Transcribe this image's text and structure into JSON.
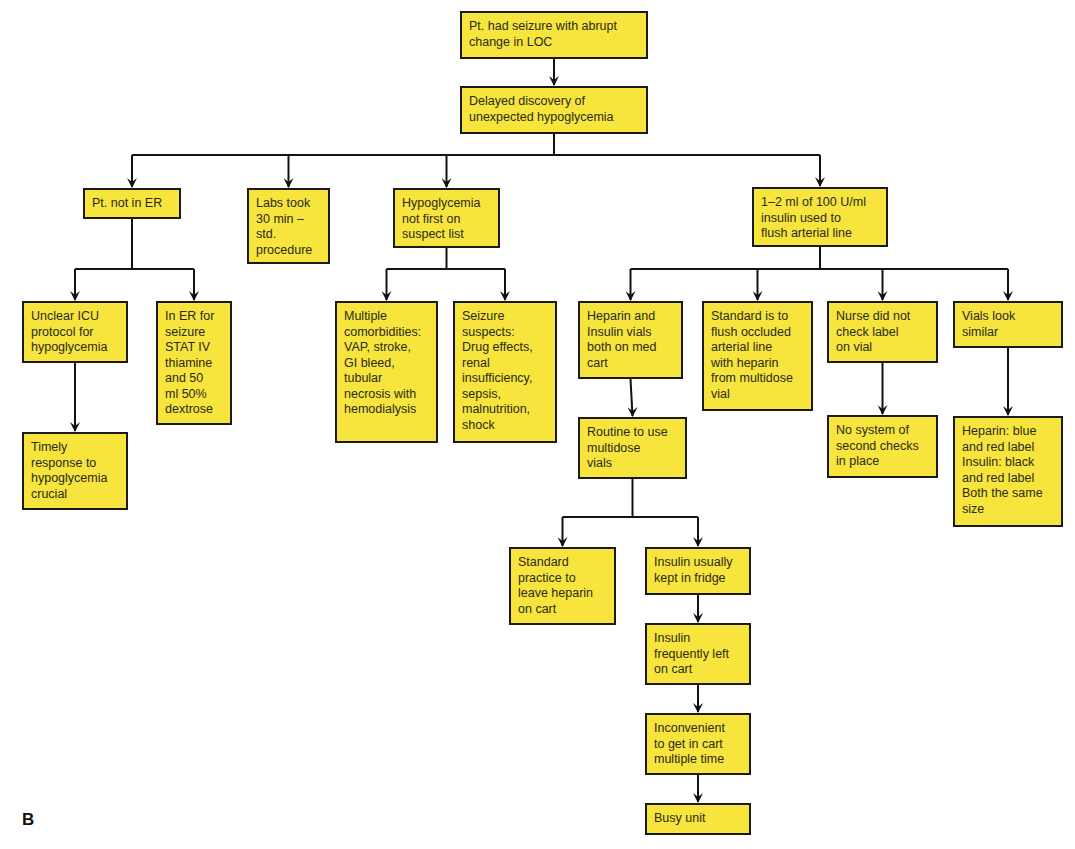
{
  "panel_label": "B",
  "colors": {
    "box_fill": "#f7e43c",
    "box_border": "#1a1a1a",
    "line": "#111111"
  },
  "nodes": [
    {
      "id": "n0",
      "text": "Pt. had seizure with abrupt\nchange in LOC",
      "x": 460,
      "y": 11,
      "w": 188,
      "h": 48
    },
    {
      "id": "n1",
      "text": "Delayed discovery of\nunexpected hypoglycemia",
      "x": 460,
      "y": 86,
      "w": 188,
      "h": 48
    },
    {
      "id": "n2",
      "text": "Pt. not in ER",
      "x": 83,
      "y": 188,
      "w": 98,
      "h": 31
    },
    {
      "id": "n3",
      "text": "Labs took\n30 min –\nstd.\nprocedure",
      "x": 247,
      "y": 188,
      "w": 83,
      "h": 76
    },
    {
      "id": "n4",
      "text": "Hypoglycemia\nnot first on\nsuspect list",
      "x": 393,
      "y": 188,
      "w": 107,
      "h": 60
    },
    {
      "id": "n5",
      "text": "1–2 ml of 100 U/ml\ninsulin used to\nflush arterial line",
      "x": 752,
      "y": 187,
      "w": 136,
      "h": 60
    },
    {
      "id": "n6",
      "text": "Unclear ICU\nprotocol for\nhypoglycemia",
      "x": 22,
      "y": 301,
      "w": 106,
      "h": 62
    },
    {
      "id": "n7",
      "text": "In ER for\nseizure\nSTAT IV\nthiamine\nand 50\nml 50%\ndextrose",
      "x": 156,
      "y": 301,
      "w": 76,
      "h": 124
    },
    {
      "id": "n8",
      "text": "Multiple\ncomorbidities:\nVAP, stroke,\nGI bleed,\ntubular\nnecrosis with\nhemodialysis",
      "x": 335,
      "y": 301,
      "w": 103,
      "h": 142
    },
    {
      "id": "n9",
      "text": "Seizure\nsuspects:\nDrug effects,\nrenal\ninsufficiency,\nsepsis,\nmalnutrition,\nshock",
      "x": 453,
      "y": 301,
      "w": 104,
      "h": 142
    },
    {
      "id": "n10",
      "text": "Heparin and\nInsulin vials\nboth on med\ncart",
      "x": 578,
      "y": 301,
      "w": 105,
      "h": 78
    },
    {
      "id": "n11",
      "text": "Standard is to\nflush occluded\narterial line\nwith heparin\nfrom multidose\nvial",
      "x": 702,
      "y": 301,
      "w": 111,
      "h": 110
    },
    {
      "id": "n12",
      "text": "Nurse did not\ncheck label\non vial",
      "x": 827,
      "y": 301,
      "w": 111,
      "h": 62
    },
    {
      "id": "n13",
      "text": "Vials look\nsimilar",
      "x": 953,
      "y": 301,
      "w": 110,
      "h": 47
    },
    {
      "id": "n14",
      "text": "Routine to use\nmultidose\nvials",
      "x": 578,
      "y": 417,
      "w": 109,
      "h": 62
    },
    {
      "id": "n15",
      "text": "Timely\nresponse to\nhypoglycemia\ncrucial",
      "x": 22,
      "y": 432,
      "w": 106,
      "h": 78
    },
    {
      "id": "n16",
      "text": "No system of\nsecond checks\nin place",
      "x": 827,
      "y": 415,
      "w": 111,
      "h": 63
    },
    {
      "id": "n17",
      "text": "Heparin: blue\nand red label\nInsulin: black\nand red label\nBoth the same\nsize",
      "x": 953,
      "y": 416,
      "w": 110,
      "h": 111
    },
    {
      "id": "n18",
      "text": "Standard\npractice to\nleave heparin\non cart",
      "x": 509,
      "y": 547,
      "w": 107,
      "h": 78
    },
    {
      "id": "n19",
      "text": "Insulin usually\nkept in fridge",
      "x": 645,
      "y": 547,
      "w": 106,
      "h": 48
    },
    {
      "id": "n20",
      "text": "Insulin\nfrequently left\non cart",
      "x": 645,
      "y": 623,
      "w": 106,
      "h": 62
    },
    {
      "id": "n21",
      "text": "Inconvenient\nto get in cart\nmultiple time",
      "x": 645,
      "y": 713,
      "w": 106,
      "h": 62
    },
    {
      "id": "n22",
      "text": "Busy unit",
      "x": 645,
      "y": 803,
      "w": 106,
      "h": 32
    }
  ],
  "edges": [
    {
      "from": "n0",
      "to": "n1"
    },
    {
      "from": "n1",
      "to": [
        "n2",
        "n3",
        "n4",
        "n5"
      ],
      "bus_y": 155
    },
    {
      "from": "n2",
      "to": [
        "n6",
        "n7"
      ],
      "bus_y": 269
    },
    {
      "from": "n4",
      "to": [
        "n8",
        "n9"
      ],
      "bus_y": 269
    },
    {
      "from": "n5",
      "to": [
        "n10",
        "n11",
        "n12",
        "n13"
      ],
      "bus_y": 269
    },
    {
      "from": "n6",
      "to": "n15"
    },
    {
      "from": "n10",
      "to": "n14"
    },
    {
      "from": "n12",
      "to": "n16"
    },
    {
      "from": "n13",
      "to": "n17"
    },
    {
      "from": "n14",
      "to": [
        "n18",
        "n19"
      ],
      "bus_y": 517
    },
    {
      "from": "n19",
      "to": "n20"
    },
    {
      "from": "n20",
      "to": "n21"
    },
    {
      "from": "n21",
      "to": "n22"
    }
  ]
}
